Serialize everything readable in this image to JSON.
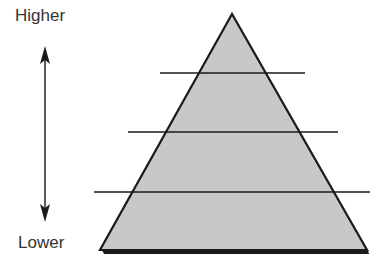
{
  "diagram": {
    "type": "pyramid",
    "top_label": "Higher",
    "bottom_label": "Lower",
    "levels": 4,
    "colors": {
      "fill": "#c8c8c8",
      "stroke": "#1a1a1a",
      "text": "#333333"
    }
  }
}
